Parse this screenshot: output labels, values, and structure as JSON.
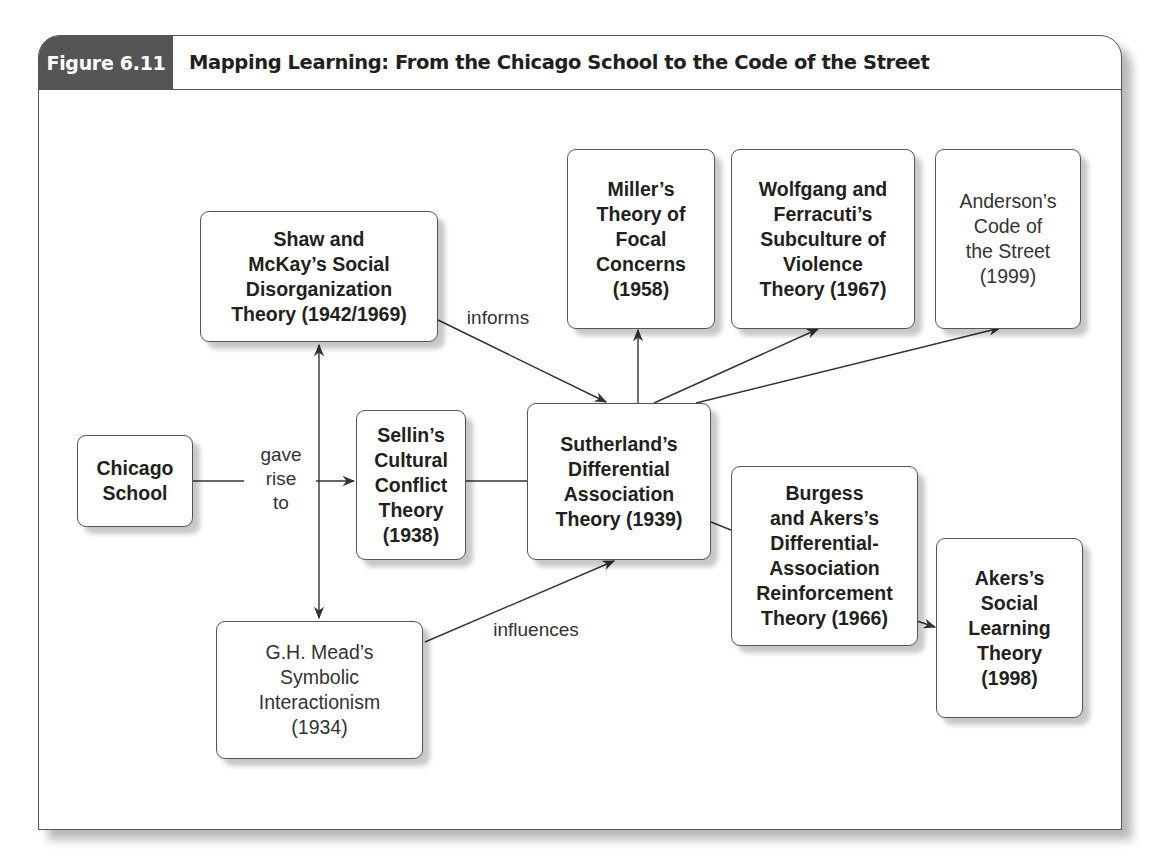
{
  "figure": {
    "label": "Figure 6.11",
    "title": "Mapping Learning: From the Chicago School to the Code of the Street"
  },
  "nodes": {
    "chicago_school": {
      "text": "Chicago\nSchool",
      "weight": "bold"
    },
    "shaw_mckay": {
      "text": "Shaw and\nMcKay’s Social\nDisorganization\nTheory (1942/1969)",
      "weight": "bold"
    },
    "sellin": {
      "text": "Sellin’s\nCultural\nConflict\nTheory\n(1938)",
      "weight": "bold"
    },
    "sutherland": {
      "text": "Sutherland’s\nDifferential\nAssociation\nTheory (1939)",
      "weight": "bold"
    },
    "mead": {
      "text": "G.H. Mead’s\nSymbolic\nInteractionism\n(1934)",
      "weight": "normal"
    },
    "miller": {
      "text": "Miller’s\nTheory of\nFocal\nConcerns\n(1958)",
      "weight": "bold"
    },
    "wolfgang_ferracuti": {
      "text": "Wolfgang and\nFerracuti’s\nSubculture of\nViolence\nTheory (1967)",
      "weight": "bold"
    },
    "anderson": {
      "text": "Anderson’s\nCode of\nthe Street\n(1999)",
      "weight": "normal"
    },
    "burgess_akers": {
      "text": "Burgess\nand Akers’s\nDifferential-\nAssociation\nReinforcement\nTheory (1966)",
      "weight": "bold"
    },
    "akers": {
      "text": "Akers’s\nSocial\nLearning\nTheory\n(1998)",
      "weight": "bold"
    }
  },
  "edge_labels": {
    "gave_rise_to": "gave\nrise\nto",
    "informs": "informs",
    "influences": "influences"
  },
  "edges": [
    {
      "from": "chicago_school",
      "to": "sellin",
      "label": "gave rise to"
    },
    {
      "from": "chicago_school",
      "to": "shaw_mckay",
      "label": "gave rise to"
    },
    {
      "from": "chicago_school",
      "to": "mead",
      "label": "gave rise to"
    },
    {
      "from": "shaw_mckay",
      "to": "sutherland",
      "label": "informs"
    },
    {
      "from": "sellin",
      "to": "sutherland",
      "label": ""
    },
    {
      "from": "mead",
      "to": "sutherland",
      "label": "influences"
    },
    {
      "from": "sutherland",
      "to": "miller",
      "label": ""
    },
    {
      "from": "sutherland",
      "to": "wolfgang_ferracuti",
      "label": ""
    },
    {
      "from": "sutherland",
      "to": "anderson",
      "label": ""
    },
    {
      "from": "sutherland",
      "to": "burgess_akers",
      "label": ""
    },
    {
      "from": "burgess_akers",
      "to": "akers",
      "label": ""
    }
  ],
  "colors": {
    "label_band": "#555555",
    "border": "#555555",
    "text": "#231f20"
  }
}
